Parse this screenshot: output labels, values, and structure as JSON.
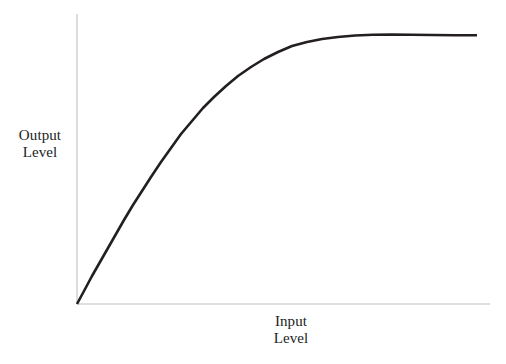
{
  "figure": {
    "background_color": "#ffffff",
    "width": 506,
    "height": 364
  },
  "axes": {
    "y_axis": {
      "label_line1": "Output",
      "label_line2": "Level",
      "color": "#d4d4d4",
      "x_px": 77,
      "y_top_px": 14,
      "y_bottom_px": 304
    },
    "x_axis": {
      "label_line1": "Input",
      "label_line2": "Level",
      "color": "#d4d4d4",
      "y_px": 304,
      "x_left_px": 77,
      "x_right_px": 490
    }
  },
  "chart_data": {
    "type": "line",
    "title": "",
    "subtitle": "",
    "xlabel": "Input Level",
    "ylabel": "Output Level",
    "grid": false,
    "legend": false,
    "legend_position": "none",
    "xlim": [
      0,
      1
    ],
    "ylim": [
      0,
      1
    ],
    "xticks": [],
    "yticks": [],
    "xticklabels": [],
    "yticklabels": [],
    "annotations": [],
    "series": [
      {
        "name": "Transfer Curve",
        "color": "#231f1f",
        "line_width_px": 2.6,
        "description": "Saturating compression curve: steep near-linear rise from the origin that gradually rolls off and flattens into a plateau at maximum output.",
        "x": [
          0.0,
          0.04,
          0.08,
          0.12,
          0.16,
          0.2,
          0.25,
          0.3,
          0.35,
          0.4,
          0.45,
          0.5,
          0.55,
          0.6,
          0.65,
          0.7,
          0.75,
          0.8,
          0.85,
          0.9,
          0.95,
          1.0
        ],
        "y": [
          0.0,
          0.07,
          0.15,
          0.23,
          0.31,
          0.39,
          0.48,
          0.57,
          0.65,
          0.72,
          0.79,
          0.85,
          0.9,
          0.94,
          0.96,
          0.975,
          0.982,
          0.985,
          0.984,
          0.983,
          0.983,
          0.983
        ]
      }
    ]
  },
  "curve_pixels": {
    "points": [
      [
        77,
        304
      ],
      [
        84,
        291
      ],
      [
        92,
        276
      ],
      [
        100,
        262
      ],
      [
        108,
        248
      ],
      [
        116,
        234
      ],
      [
        124,
        220
      ],
      [
        133,
        205
      ],
      [
        142,
        191
      ],
      [
        151,
        177
      ],
      [
        161,
        162
      ],
      [
        171,
        148
      ],
      [
        181,
        134
      ],
      [
        192,
        121
      ],
      [
        203,
        108
      ],
      [
        214,
        97
      ],
      [
        226,
        86
      ],
      [
        238,
        76
      ],
      [
        251,
        67
      ],
      [
        264,
        59
      ],
      [
        278,
        52
      ],
      [
        292,
        46
      ],
      [
        307,
        42
      ],
      [
        322,
        39
      ],
      [
        338,
        37
      ],
      [
        355,
        35.5
      ],
      [
        373,
        34.8
      ],
      [
        392,
        34.5
      ],
      [
        412,
        34.7
      ],
      [
        432,
        35
      ],
      [
        455,
        35.2
      ],
      [
        477,
        35.2
      ]
    ]
  }
}
